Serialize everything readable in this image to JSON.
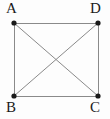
{
  "figure": {
    "width": 110,
    "height": 119,
    "background_color": "#fdfdfd",
    "edge_color": "#8a8a8a",
    "diagonal_color": "#8a8a8a",
    "vertex_color": "#1a1a1a",
    "label_color": "#1a1a1a",
    "edge_width": 1,
    "vertex_radius": 2.6
  },
  "vertices": [
    {
      "id": "A",
      "label": "A",
      "x": 14,
      "y": 23,
      "label_x": 6,
      "label_y": 1,
      "position": "top-left"
    },
    {
      "id": "D",
      "label": "D",
      "x": 98,
      "y": 23,
      "label_x": 90,
      "label_y": 1,
      "position": "top-right"
    },
    {
      "id": "B",
      "label": "B",
      "x": 14,
      "y": 96,
      "label_x": 6,
      "label_y": 100,
      "position": "bottom-left"
    },
    {
      "id": "C",
      "label": "C",
      "x": 98,
      "y": 96,
      "label_x": 90,
      "label_y": 100,
      "position": "bottom-right"
    }
  ],
  "edges": [
    {
      "id": "AD",
      "from": "A",
      "to": "D",
      "kind": "side"
    },
    {
      "id": "AB",
      "from": "A",
      "to": "B",
      "kind": "side"
    },
    {
      "id": "DC",
      "from": "D",
      "to": "C",
      "kind": "side"
    },
    {
      "id": "BC",
      "from": "B",
      "to": "C",
      "kind": "side"
    },
    {
      "id": "AC",
      "from": "A",
      "to": "C",
      "kind": "diagonal"
    },
    {
      "id": "DB",
      "from": "D",
      "to": "B",
      "kind": "diagonal"
    }
  ],
  "intersection": {
    "x": 56,
    "y": 59.5
  }
}
